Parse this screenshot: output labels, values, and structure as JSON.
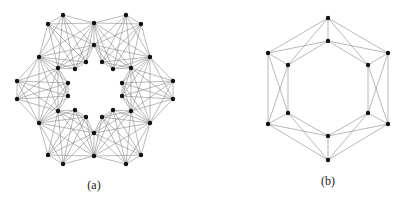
{
  "figures": [
    {
      "id": "a",
      "caption": "(a)",
      "caption_pos": [
        94,
        178
      ],
      "nodes": [
        [
          63,
          15
        ],
        [
          48,
          24
        ],
        [
          94,
          23
        ],
        [
          126,
          15
        ],
        [
          141,
          24
        ],
        [
          39,
          57
        ],
        [
          150,
          57
        ],
        [
          94,
          45
        ],
        [
          58,
          68
        ],
        [
          75,
          69
        ],
        [
          86,
          62
        ],
        [
          102,
          62
        ],
        [
          113,
          69
        ],
        [
          131,
          68
        ],
        [
          17,
          81
        ],
        [
          17,
          99
        ],
        [
          173,
          81
        ],
        [
          173,
          99
        ],
        [
          68,
          83
        ],
        [
          68,
          96
        ],
        [
          122,
          83
        ],
        [
          122,
          96
        ],
        [
          58,
          111
        ],
        [
          75,
          110
        ],
        [
          86,
          117
        ],
        [
          102,
          117
        ],
        [
          113,
          110
        ],
        [
          131,
          111
        ],
        [
          39,
          123
        ],
        [
          150,
          123
        ],
        [
          94,
          133
        ],
        [
          48,
          155
        ],
        [
          63,
          164
        ],
        [
          94,
          156
        ],
        [
          126,
          164
        ],
        [
          141,
          155
        ]
      ],
      "cliques": [
        [
          0,
          1,
          2,
          5,
          7,
          8,
          9,
          10
        ],
        [
          2,
          3,
          4,
          6,
          7,
          11,
          12,
          13
        ],
        [
          6,
          16,
          17,
          29,
          13,
          20,
          21,
          27
        ],
        [
          29,
          34,
          35,
          33,
          30,
          25,
          26,
          27
        ],
        [
          28,
          31,
          32,
          33,
          30,
          22,
          23,
          24
        ],
        [
          5,
          14,
          15,
          28,
          8,
          18,
          19,
          22
        ]
      ]
    },
    {
      "id": "b",
      "caption": "(b)",
      "caption_pos": [
        328,
        174
      ],
      "nodes": [
        [
          328,
          18
        ],
        [
          388,
          53
        ],
        [
          388,
          124
        ],
        [
          328,
          160
        ],
        [
          268,
          124
        ],
        [
          268,
          53
        ],
        [
          328,
          41
        ],
        [
          368,
          65
        ],
        [
          368,
          113
        ],
        [
          328,
          136
        ],
        [
          288,
          113
        ],
        [
          288,
          65
        ]
      ],
      "edges": [
        [
          0,
          1
        ],
        [
          1,
          2
        ],
        [
          2,
          3
        ],
        [
          3,
          4
        ],
        [
          4,
          5
        ],
        [
          5,
          0
        ],
        [
          6,
          7
        ],
        [
          7,
          8
        ],
        [
          8,
          9
        ],
        [
          9,
          10
        ],
        [
          10,
          11
        ],
        [
          11,
          6
        ],
        [
          0,
          6
        ],
        [
          3,
          9
        ],
        [
          0,
          11
        ],
        [
          0,
          7
        ],
        [
          3,
          10
        ],
        [
          3,
          8
        ],
        [
          5,
          6
        ],
        [
          1,
          6
        ],
        [
          4,
          9
        ],
        [
          2,
          9
        ],
        [
          5,
          10
        ],
        [
          4,
          11
        ],
        [
          1,
          8
        ],
        [
          2,
          7
        ],
        [
          5,
          11
        ],
        [
          4,
          10
        ],
        [
          1,
          7
        ],
        [
          2,
          8
        ]
      ]
    }
  ]
}
